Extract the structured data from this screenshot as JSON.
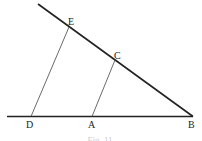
{
  "figure": {
    "caption": "Fig. 11",
    "points": {
      "B": {
        "label": "B",
        "x": 193,
        "y": 116
      },
      "D": {
        "label": "D",
        "x": 31,
        "y": 116
      },
      "A": {
        "label": "A",
        "x": 92,
        "y": 116
      },
      "E": {
        "label": "E",
        "x": 69,
        "y": 27
      },
      "C": {
        "label": "C",
        "x": 115,
        "y": 60
      }
    },
    "lines": [
      {
        "name": "baseline",
        "from": "left-end",
        "to": "B",
        "style": "thick"
      },
      {
        "name": "upper-line",
        "from": "top-end",
        "to": "B",
        "style": "thick"
      },
      {
        "name": "segment-DE",
        "from": "D",
        "to": "E",
        "style": "thin"
      },
      {
        "name": "segment-AC",
        "from": "A",
        "to": "C",
        "style": "thin"
      }
    ],
    "colors": {
      "stroke": "#222222",
      "background": "#ffffff"
    }
  }
}
